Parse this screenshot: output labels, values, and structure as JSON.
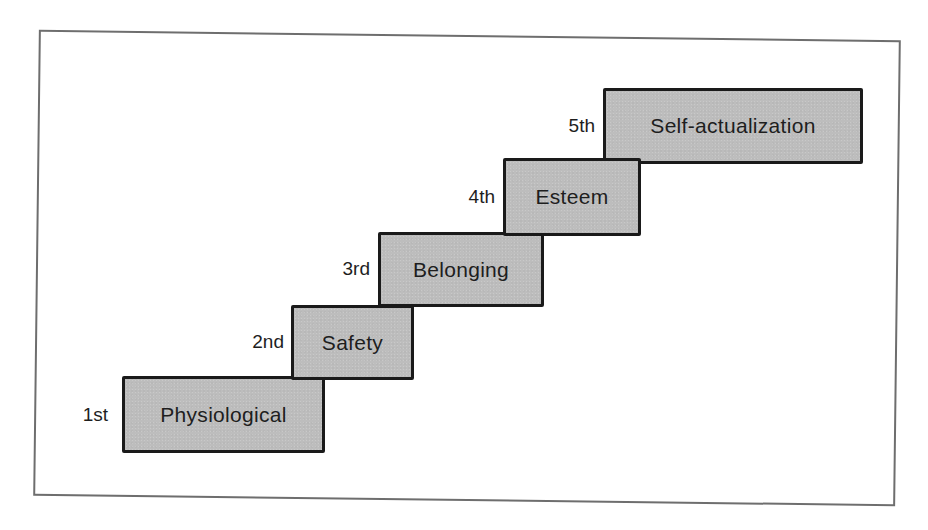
{
  "diagram": {
    "title": "",
    "type": "staircase",
    "colors": {
      "box_fill": "#bdbdbd",
      "box_border": "#1a1a1a",
      "text": "#1e1e1e",
      "frame_border": "#6e6e6e",
      "background": "#ffffff"
    },
    "steps": [
      {
        "ordinal": "1st",
        "label": "Physiological"
      },
      {
        "ordinal": "2nd",
        "label": "Safety"
      },
      {
        "ordinal": "3rd",
        "label": "Belonging"
      },
      {
        "ordinal": "4th",
        "label": "Esteem"
      },
      {
        "ordinal": "5th",
        "label": "Self-actualization"
      }
    ]
  }
}
